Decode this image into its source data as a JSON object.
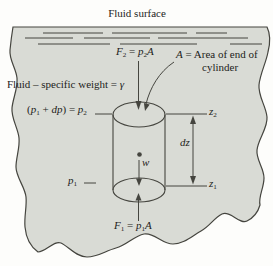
{
  "colors": {
    "fluid_fill": "#d9dbd5",
    "ink": "#45453f",
    "text": "#1d1d1b",
    "background": "#fdfdfb"
  },
  "labels": {
    "fluid_surface": [
      {
        "t": "Fluid surface"
      }
    ],
    "f2": [
      {
        "t": "F",
        "i": 1
      },
      {
        "t": "2",
        "sub": 1
      },
      {
        "t": " = "
      },
      {
        "t": "p",
        "i": 1
      },
      {
        "t": "2",
        "sub": 1
      },
      {
        "t": "A",
        "i": 1
      }
    ],
    "area_line1": [
      {
        "t": "A",
        "i": 1
      },
      {
        "t": " = Area of end of"
      }
    ],
    "area_line2": [
      {
        "t": "cylinder"
      }
    ],
    "specific_weight": [
      {
        "t": "Fluid – specific weight = "
      },
      {
        "t": "γ",
        "i": 1
      }
    ],
    "p1dp": [
      {
        "t": "("
      },
      {
        "t": "p",
        "i": 1
      },
      {
        "t": "1",
        "sub": 1
      },
      {
        "t": " + "
      },
      {
        "t": "dp",
        "i": 1
      },
      {
        "t": ") = "
      },
      {
        "t": "p",
        "i": 1
      },
      {
        "t": "2",
        "sub": 1
      }
    ],
    "z2": [
      {
        "t": "z",
        "i": 1
      },
      {
        "t": "2",
        "sub": 1
      }
    ],
    "dz": [
      {
        "t": "dz",
        "i": 1
      }
    ],
    "z1": [
      {
        "t": "z",
        "i": 1
      },
      {
        "t": "1",
        "sub": 1
      }
    ],
    "w": [
      {
        "t": "w",
        "i": 1
      }
    ],
    "p1": [
      {
        "t": "p",
        "i": 1
      },
      {
        "t": "1",
        "sub": 1
      }
    ],
    "f1": [
      {
        "t": "F",
        "i": 1
      },
      {
        "t": "1",
        "sub": 1
      },
      {
        "t": " = "
      },
      {
        "t": "p",
        "i": 1
      },
      {
        "t": "1",
        "sub": 1
      },
      {
        "t": "A",
        "i": 1
      }
    ]
  }
}
